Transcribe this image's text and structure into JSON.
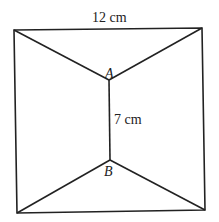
{
  "diagram": {
    "top_length_label": "12 cm",
    "middle_length_label": "7 cm",
    "point_a_label": "A",
    "point_b_label": "B",
    "stroke_color": "#222222"
  }
}
